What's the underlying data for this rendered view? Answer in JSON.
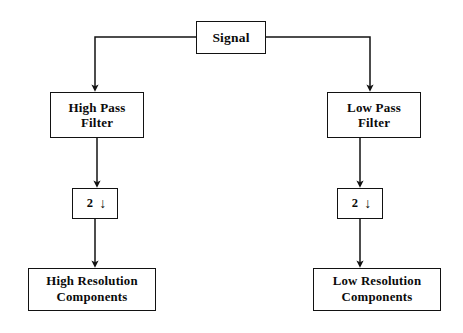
{
  "diagram": {
    "background_color": "#ffffff",
    "line_color": "#121212",
    "text_color": "#0b0b0b",
    "nodes": [
      {
        "id": "signal",
        "label": "Signal",
        "role": "source"
      },
      {
        "id": "highpass",
        "label": "High Pass\nFilter",
        "role": "filter"
      },
      {
        "id": "lowpass",
        "label": "Low Pass\nFilter",
        "role": "filter"
      },
      {
        "id": "down_left",
        "label": "2",
        "arrow_glyph": "↓",
        "role": "downsampler"
      },
      {
        "id": "down_right",
        "label": "2",
        "arrow_glyph": "↓",
        "role": "downsampler"
      },
      {
        "id": "high_res",
        "label": "High Resolution\nComponents",
        "role": "output"
      },
      {
        "id": "low_res",
        "label": "Low Resolution\nComponents",
        "role": "output"
      }
    ],
    "edges": [
      {
        "from": "signal",
        "to": "highpass",
        "style": "elbow-left"
      },
      {
        "from": "signal",
        "to": "lowpass",
        "style": "elbow-right"
      },
      {
        "from": "highpass",
        "to": "down_left",
        "style": "straight"
      },
      {
        "from": "lowpass",
        "to": "down_right",
        "style": "straight"
      },
      {
        "from": "down_left",
        "to": "high_res",
        "style": "straight"
      },
      {
        "from": "down_right",
        "to": "low_res",
        "style": "straight"
      }
    ]
  }
}
